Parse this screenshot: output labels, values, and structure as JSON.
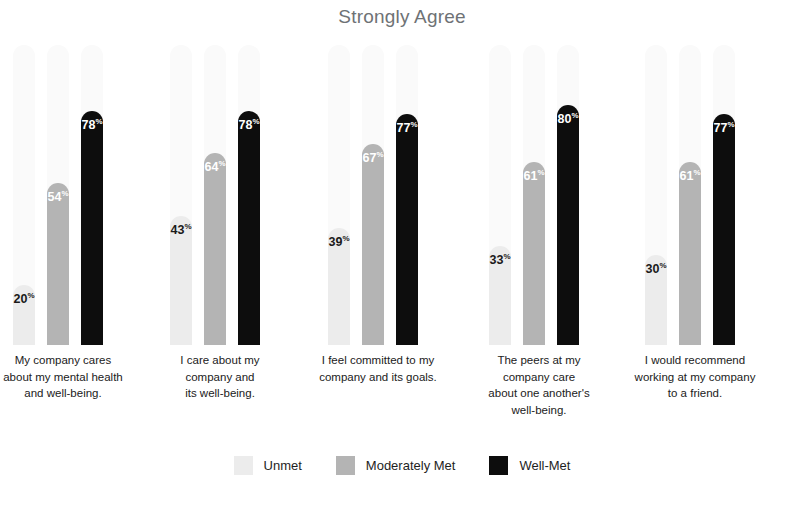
{
  "chart_data": {
    "type": "bar",
    "title": "Strongly Agree",
    "xlabel": "",
    "ylabel": "",
    "ylim": [
      0,
      100
    ],
    "grid": false,
    "legend_position": "bottom",
    "categories": [
      "My company cares about my mental health and well-being.",
      "I care about my company and its well-being.",
      "I feel committed to my company and its goals.",
      "The peers at my company care about one another's well-being.",
      "I would recommend working at my company to a friend."
    ],
    "category_lines": [
      [
        "My company cares",
        "about my mental health",
        "and well-being."
      ],
      [
        "I care about my",
        "company and",
        "its well-being."
      ],
      [
        "I feel committed to my",
        "company and its goals."
      ],
      [
        "The peers at my",
        "company care",
        "about one another's",
        "well-being."
      ],
      [
        "I would recommend",
        "working at my company",
        "to a friend."
      ]
    ],
    "series": [
      {
        "name": "Unmet",
        "color": "#ececec",
        "values": [
          20,
          43,
          39,
          33,
          30
        ]
      },
      {
        "name": "Moderately Met",
        "color": "#b4b4b4",
        "values": [
          54,
          64,
          67,
          61,
          61
        ]
      },
      {
        "name": "Well-Met",
        "color": "#0d0d0d",
        "values": [
          78,
          78,
          77,
          80,
          77
        ]
      }
    ],
    "value_suffix": "%"
  },
  "legend": {
    "items": [
      {
        "label": "Unmet",
        "swatch_class": "series-unmet"
      },
      {
        "label": "Moderately Met",
        "swatch_class": "series-mod"
      },
      {
        "label": "Well-Met",
        "swatch_class": "series-well"
      }
    ]
  },
  "colors": {
    "title": "#6e7275",
    "unmet": "#ececec",
    "moderately_met": "#b4b4b4",
    "well_met": "#0d0d0d",
    "track": "#fafafa",
    "label_text": "#212121",
    "background": "#ffffff"
  },
  "layout": {
    "group_left_positions": [
      13,
      170,
      328,
      489,
      645
    ],
    "group_width": 100,
    "bar_width": 22,
    "bar_gap": 12,
    "plot_height": 300,
    "max_value": 100
  }
}
